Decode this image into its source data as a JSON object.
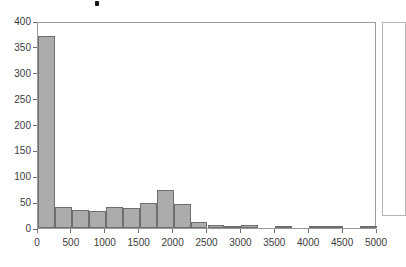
{
  "chart_data": {
    "type": "bar",
    "title": "",
    "xlabel": "",
    "ylabel": "",
    "grid": false,
    "legend_position": "right",
    "legend_entries": [],
    "xlim": [
      0,
      5000
    ],
    "ylim": [
      0,
      400
    ],
    "bin_width": 250,
    "x_ticks": [
      0,
      500,
      1000,
      1500,
      2000,
      2500,
      3000,
      3500,
      4000,
      4500,
      5000
    ],
    "x_tick_labels": [
      "0",
      "500",
      "1000",
      "1500",
      "2000",
      "2500",
      "3000",
      "3500",
      "4000",
      "4500",
      "5000"
    ],
    "y_ticks": [
      0,
      50,
      100,
      150,
      200,
      250,
      300,
      350,
      400
    ],
    "y_tick_labels": [
      "0",
      "50",
      "100",
      "150",
      "200",
      "250",
      "300",
      "350",
      "400"
    ],
    "bin_edges": [
      0,
      250,
      500,
      750,
      1000,
      1250,
      1500,
      1750,
      2000,
      2250,
      2500,
      2750,
      3000,
      3250,
      3500,
      3750,
      4000,
      4250,
      4500,
      4750,
      5000
    ],
    "categories": [
      "0-250",
      "250-500",
      "500-750",
      "750-1000",
      "1000-1250",
      "1250-1500",
      "1500-1750",
      "1750-2000",
      "2000-2250",
      "2250-2500",
      "2500-2750",
      "2750-3000",
      "3000-3250",
      "3250-3500",
      "3500-3750",
      "3750-4000",
      "4000-4250",
      "4250-4500",
      "4500-4750",
      "4750-5000"
    ],
    "values": [
      372,
      40,
      35,
      33,
      40,
      39,
      48,
      74,
      46,
      11,
      6,
      2,
      6,
      0,
      4,
      0,
      2,
      2,
      0,
      2
    ],
    "bar_color": "#acacac",
    "bar_edge_color": "#6e6e6e"
  },
  "figure": {
    "axis_color": "#6e6e6e",
    "panel_border_color": "#9a9a9a",
    "legend_border_color": "#b4b4b4",
    "background": "#ffffff",
    "tick_label_color": "#3b3b3b"
  }
}
